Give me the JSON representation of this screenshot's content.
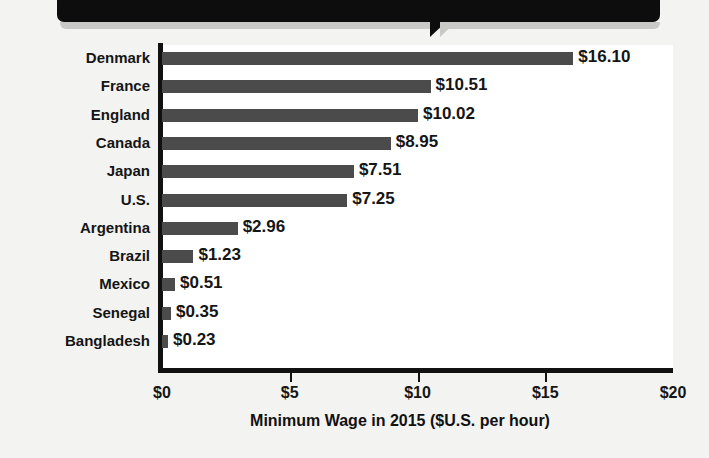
{
  "banner": {
    "text": "",
    "color": "#0d0d0d"
  },
  "chart_data": {
    "type": "bar",
    "orientation": "horizontal",
    "title": "",
    "xlabel": "Minimum Wage in 2015 ($U.S. per hour)",
    "ylabel": "",
    "xlim": [
      0,
      20
    ],
    "xticks": [
      "$0",
      "$5",
      "$10",
      "$15",
      "$20"
    ],
    "xtick_values": [
      0,
      5,
      10,
      15,
      20
    ],
    "grid": false,
    "legend": false,
    "bar_color": "#4b4b4b",
    "categories": [
      "Denmark",
      "France",
      "England",
      "Canada",
      "Japan",
      "U.S.",
      "Argentina",
      "Brazil",
      "Mexico",
      "Senegal",
      "Bangladesh"
    ],
    "values": [
      16.1,
      10.51,
      10.02,
      8.95,
      7.51,
      7.25,
      2.96,
      1.23,
      0.51,
      0.35,
      0.23
    ],
    "data_labels": [
      "$16.10",
      "$10.51",
      "$10.02",
      "$8.95",
      "$7.51",
      "$7.25",
      "$2.96",
      "$1.23",
      "$0.51",
      "$0.35",
      "$0.23"
    ]
  }
}
